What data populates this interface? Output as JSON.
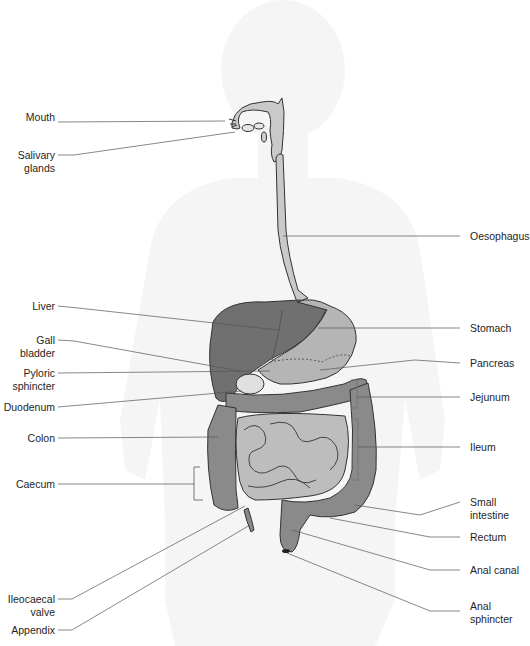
{
  "diagram": {
    "colors": {
      "silhouette": "#f4f4f4",
      "esophagus": "#c9c9c9",
      "liver": "#6f6f6f",
      "stomach": "#b4b4b4",
      "colon": "#8a8a8a",
      "small_intestine": "#bdbdbd",
      "pancreas": "#a0a0a0",
      "outline": "#3a3a3a",
      "leader": "#555555",
      "text": "#1e1e1e"
    },
    "labels_left": [
      {
        "id": "mouth",
        "text": "Mouth",
        "x": 55,
        "y": 117
      },
      {
        "id": "salivary-glands",
        "text": "Salivary\nglands",
        "x": 55,
        "y": 149
      },
      {
        "id": "liver",
        "text": "Liver",
        "x": 55,
        "y": 301
      },
      {
        "id": "gall-bladder",
        "text": "Gall bladder",
        "x": 55,
        "y": 335
      },
      {
        "id": "pyloric-sphincter",
        "text": "Pyloric\nsphincter",
        "x": 55,
        "y": 366
      },
      {
        "id": "duodenum",
        "text": "Duodenum",
        "x": 55,
        "y": 400
      },
      {
        "id": "colon",
        "text": "Colon",
        "x": 55,
        "y": 432
      },
      {
        "id": "caecum",
        "text": "Caecum",
        "x": 55,
        "y": 478
      },
      {
        "id": "ileocaecal-valve",
        "text": "Ileocaecal\nvalve",
        "x": 55,
        "y": 589
      },
      {
        "id": "appendix",
        "text": "Appendix",
        "x": 55,
        "y": 624
      }
    ],
    "labels_right": [
      {
        "id": "oesophagus",
        "text": "Oesophagus",
        "x": 470,
        "y": 230
      },
      {
        "id": "stomach",
        "text": "Stomach",
        "x": 470,
        "y": 322
      },
      {
        "id": "pancreas",
        "text": "Pancreas",
        "x": 470,
        "y": 358
      },
      {
        "id": "jejunum",
        "text": "Jejunum",
        "x": 470,
        "y": 391
      },
      {
        "id": "ileum",
        "text": "Ileum",
        "x": 470,
        "y": 442
      },
      {
        "id": "small-intestine",
        "text": "Small\nintestine",
        "x": 470,
        "y": 496
      },
      {
        "id": "rectum",
        "text": "Rectum",
        "x": 470,
        "y": 531
      },
      {
        "id": "anal-canal",
        "text": "Anal canal",
        "x": 470,
        "y": 565
      },
      {
        "id": "anal-sphincter",
        "text": "Anal\nsphincter",
        "x": 470,
        "y": 605
      }
    ]
  }
}
